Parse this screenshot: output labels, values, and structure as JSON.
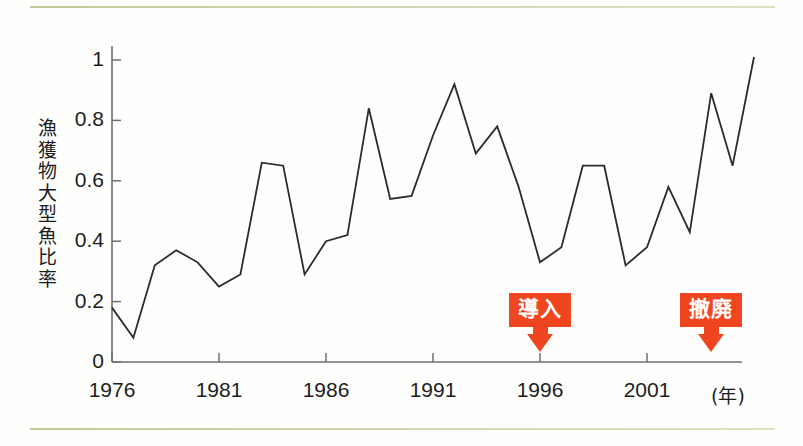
{
  "chart_data": {
    "type": "line",
    "title": "",
    "xlabel": "(年)",
    "ylabel": "漁獲物大型魚比率",
    "xlim": [
      1976,
      2003
    ],
    "ylim": [
      0,
      1.08
    ],
    "grid": false,
    "legend": "none",
    "x_tick_labels": [
      "1976",
      "1981",
      "1986",
      "1991",
      "1996",
      "2001"
    ],
    "x_tick_values": [
      1976,
      1981,
      1986,
      1991,
      1996,
      2001
    ],
    "y_tick_labels": [
      "0",
      "0.2",
      "0.4",
      "0.6",
      "0.8",
      "1"
    ],
    "y_tick_values": [
      0,
      0.2,
      0.4,
      0.6,
      0.8,
      1
    ],
    "x": [
      1976,
      1977,
      1978,
      1979,
      1980,
      1981,
      1982,
      1983,
      1984,
      1985,
      1986,
      1987,
      1988,
      1989,
      1990,
      1991,
      1992,
      1993,
      1994,
      1995,
      1996,
      1997,
      1998,
      1999,
      2000,
      2001,
      2002,
      2003
    ],
    "values": [
      0.18,
      0.08,
      0.32,
      0.37,
      0.33,
      0.25,
      0.29,
      0.66,
      0.65,
      0.29,
      0.4,
      0.42,
      0.84,
      0.54,
      0.55,
      0.75,
      0.92,
      0.69,
      0.78,
      0.58,
      0.33,
      0.38,
      0.65,
      0.65,
      0.32,
      0.38,
      0.58,
      0.43
    ],
    "series": [
      {
        "name": "漁獲物大型魚比率",
        "values": [
          0.18,
          0.08,
          0.32,
          0.37,
          0.33,
          0.25,
          0.29,
          0.66,
          0.65,
          0.29,
          0.4,
          0.42,
          0.84,
          0.54,
          0.55,
          0.75,
          0.92,
          0.69,
          0.78,
          0.58,
          0.33,
          0.38,
          0.65,
          0.65,
          0.32,
          0.38,
          0.58,
          0.43
        ],
        "color": "#2b2b2b"
      }
    ],
    "tail_x": [
      2004,
      2005,
      2006
    ],
    "tail_values": [
      0.89,
      0.65,
      1.01
    ],
    "annotations": [
      {
        "label": "導入",
        "x": 1996,
        "color": "#f04620"
      },
      {
        "label": "撤廃",
        "x": 2004,
        "color": "#f04620"
      }
    ]
  },
  "axis": {
    "y_label_chars": [
      "漁",
      "獲",
      "物",
      "大",
      "型",
      "魚",
      "比",
      "率"
    ],
    "x_unit": "(年)"
  },
  "colors": {
    "line": "#2b2b2b",
    "axis": "#6e6e6e",
    "accent": "#f04620",
    "rule": "#b9bf86",
    "background": "#fefefd"
  }
}
